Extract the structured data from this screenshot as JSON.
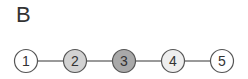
{
  "panel": {
    "label": "B"
  },
  "graph": {
    "nodes": [
      {
        "id": "1",
        "label": "1",
        "cx": 26,
        "cy": 61,
        "fill": "#ffffff"
      },
      {
        "id": "2",
        "label": "2",
        "cx": 75,
        "cy": 61,
        "fill": "#d2d2d2"
      },
      {
        "id": "3",
        "label": "3",
        "cx": 124,
        "cy": 61,
        "fill": "#a9a9a9"
      },
      {
        "id": "4",
        "label": "4",
        "cx": 173,
        "cy": 61,
        "fill": "#eeeeee"
      },
      {
        "id": "5",
        "label": "5",
        "cx": 222,
        "cy": 61,
        "fill": "#ffffff"
      }
    ],
    "edges": [
      [
        "1",
        "2"
      ],
      [
        "2",
        "3"
      ],
      [
        "3",
        "4"
      ],
      [
        "4",
        "5"
      ]
    ],
    "radius": 11.5,
    "stroke": "#555555"
  }
}
